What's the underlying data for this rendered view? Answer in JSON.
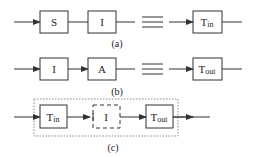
{
  "diagram": {
    "rows": [
      {
        "id": "a",
        "caption": "(a)",
        "blocks": [
          {
            "label": "S",
            "style": "solid"
          },
          {
            "label": "I",
            "style": "solid"
          },
          {
            "label": "Tin",
            "main": "T",
            "sub": "in",
            "style": "solid"
          }
        ],
        "ellipsis": "≡"
      },
      {
        "id": "b",
        "caption": "(b)",
        "blocks": [
          {
            "label": "I",
            "style": "solid"
          },
          {
            "label": "A",
            "style": "solid"
          },
          {
            "label": "Tout",
            "main": "T",
            "sub": "out",
            "style": "solid"
          }
        ],
        "ellipsis": "≡"
      },
      {
        "id": "c",
        "caption": "(c)",
        "blocks": [
          {
            "label": "Tin",
            "main": "T",
            "sub": "in",
            "style": "solid"
          },
          {
            "label": "I",
            "style": "dashed"
          },
          {
            "label": "Tout",
            "main": "T",
            "sub": "out",
            "style": "solid"
          }
        ],
        "container": "dotted"
      }
    ],
    "colors": {
      "stroke": "#333333",
      "background": "#ffffff"
    }
  }
}
